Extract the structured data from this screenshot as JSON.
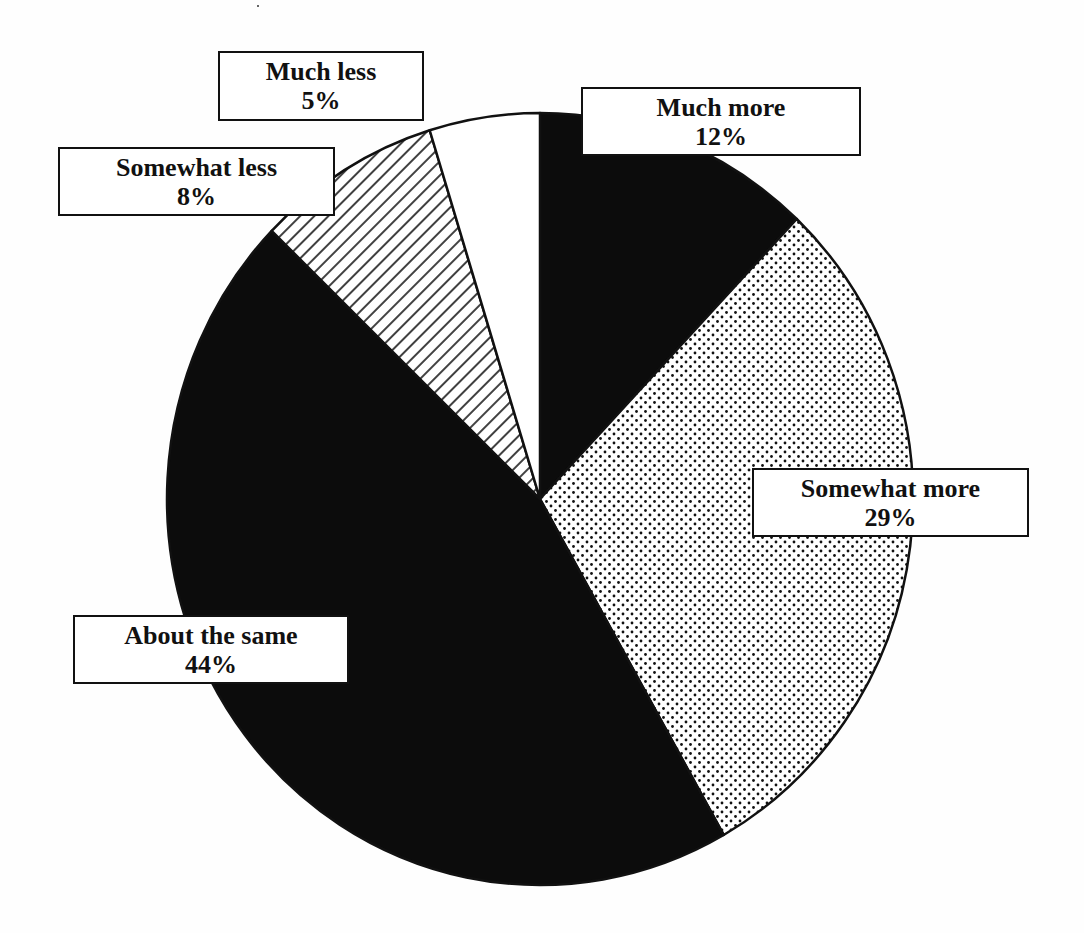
{
  "chart_data": {
    "type": "pie",
    "title": "",
    "start_angle_deg": 0,
    "direction": "clockwise",
    "center": [
      540,
      499
    ],
    "radius": [
      373,
      386
    ],
    "slices": [
      {
        "label": "Much more",
        "value": 12,
        "display": "12%",
        "pattern": "solid-black",
        "end_angle_deg": 43.5
      },
      {
        "label": "Somewhat more",
        "value": 29,
        "display": "29%",
        "pattern": "dots",
        "end_angle_deg": 150.5
      },
      {
        "label": "About the same",
        "value": 44,
        "display": "44%",
        "pattern": "solid-black",
        "end_angle_deg": 314
      },
      {
        "label": "Somewhat less",
        "value": 8,
        "display": "8%",
        "pattern": "diagonal-hatch",
        "end_angle_deg": 342.8
      },
      {
        "label": "Much less",
        "value": 5,
        "display": "5%",
        "pattern": "white",
        "end_angle_deg": 360
      }
    ],
    "labels_in_boxes": true,
    "legend": "none"
  },
  "labels": [
    {
      "key": "much_more",
      "title": "Much more",
      "percent": "12%",
      "box": {
        "left": 581,
        "top": 87,
        "width": 280,
        "height": 69
      }
    },
    {
      "key": "somewhat_more",
      "title": "Somewhat more",
      "percent": "29%",
      "box": {
        "left": 752,
        "top": 468,
        "width": 277,
        "height": 69
      }
    },
    {
      "key": "about_the_same",
      "title": "About the same",
      "percent": "44%",
      "box": {
        "left": 73,
        "top": 615,
        "width": 276,
        "height": 69
      }
    },
    {
      "key": "somewhat_less",
      "title": "Somewhat less",
      "percent": "8%",
      "box": {
        "left": 58,
        "top": 147,
        "width": 277,
        "height": 69
      }
    },
    {
      "key": "much_less",
      "title": "Much less",
      "percent": "5%",
      "box": {
        "left": 218,
        "top": 51,
        "width": 206,
        "height": 70
      }
    }
  ],
  "colors": {
    "ink": "#111111",
    "paper": "#ffffff"
  }
}
